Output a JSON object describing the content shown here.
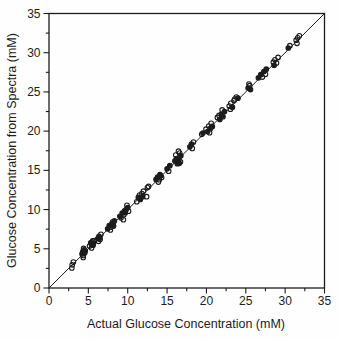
{
  "figure": {
    "background": "#fefefe",
    "ink_color": "#1c1c1c"
  },
  "chart_data": {
    "type": "scatter",
    "title": "",
    "xlabel": "Actual Glucose Concentration (mM)",
    "ylabel": "Glucose Concentration from Spectra (mM)",
    "xlim": [
      0,
      35
    ],
    "ylim": [
      0,
      35
    ],
    "x_major_ticks": [
      0,
      5,
      10,
      15,
      20,
      25,
      30,
      35
    ],
    "y_major_ticks": [
      0,
      5,
      10,
      15,
      20,
      25,
      30,
      35
    ],
    "minor_tick_interval": 2.5,
    "grid": false,
    "legend_position": "none",
    "reference_line": {
      "type": "identity",
      "from": [
        0,
        0
      ],
      "to": [
        35,
        35
      ]
    },
    "series": [
      {
        "name": "open-circles",
        "marker": "open-circle",
        "points": [
          [
            2.9,
            2.55
          ],
          [
            2.95,
            2.95
          ],
          [
            3.1,
            3.3
          ],
          [
            4.35,
            4.15
          ],
          [
            4.4,
            5.05
          ],
          [
            4.35,
            3.9
          ],
          [
            4.6,
            4.75
          ],
          [
            5.15,
            5.35
          ],
          [
            5.55,
            6.0
          ],
          [
            5.4,
            5.1
          ],
          [
            5.75,
            6.05
          ],
          [
            5.5,
            5.85
          ],
          [
            6.5,
            6.2
          ],
          [
            6.6,
            6.85
          ],
          [
            6.3,
            5.95
          ],
          [
            7.85,
            7.75
          ],
          [
            8.15,
            8.05
          ],
          [
            8.1,
            8.45
          ],
          [
            7.8,
            7.4
          ],
          [
            9.15,
            8.95
          ],
          [
            9.5,
            9.35
          ],
          [
            9.45,
            8.7
          ],
          [
            9.8,
            10.0
          ],
          [
            10.1,
            9.8
          ],
          [
            9.9,
            10.55
          ],
          [
            11.15,
            11.0
          ],
          [
            11.5,
            11.85
          ],
          [
            11.8,
            12.05
          ],
          [
            12.0,
            12.35
          ],
          [
            12.4,
            11.65
          ],
          [
            12.5,
            12.8
          ],
          [
            12.65,
            12.95
          ],
          [
            14.0,
            13.8
          ],
          [
            14.3,
            14.1
          ],
          [
            13.9,
            13.5
          ],
          [
            15.2,
            14.9
          ],
          [
            16.1,
            16.95
          ],
          [
            16.6,
            17.2
          ],
          [
            16.45,
            17.45
          ],
          [
            16.7,
            16.1
          ],
          [
            18.2,
            17.8
          ],
          [
            18.35,
            18.6
          ],
          [
            19.4,
            19.6
          ],
          [
            19.95,
            20.25
          ],
          [
            20.3,
            20.65
          ],
          [
            20.6,
            21.0
          ],
          [
            20.4,
            19.8
          ],
          [
            21.4,
            21.75
          ],
          [
            21.6,
            22.0
          ],
          [
            22.0,
            22.7
          ],
          [
            22.9,
            23.2
          ],
          [
            23.1,
            23.55
          ],
          [
            23.05,
            22.8
          ],
          [
            23.5,
            23.9
          ],
          [
            23.6,
            24.1
          ],
          [
            23.8,
            24.35
          ],
          [
            25.5,
            25.8
          ],
          [
            25.4,
            26.0
          ],
          [
            27.1,
            26.9
          ],
          [
            27.5,
            27.25
          ],
          [
            28.5,
            28.8
          ],
          [
            28.7,
            29.1
          ],
          [
            28.9,
            28.7
          ],
          [
            29.1,
            29.4
          ],
          [
            30.6,
            30.9
          ],
          [
            31.4,
            31.6
          ],
          [
            31.6,
            31.9
          ],
          [
            31.5,
            31.2
          ],
          [
            31.8,
            32.15
          ]
        ]
      },
      {
        "name": "filled-circles",
        "marker": "filled-circle",
        "points": [
          [
            4.2,
            4.35
          ],
          [
            4.3,
            4.65
          ],
          [
            4.45,
            4.85
          ],
          [
            4.55,
            4.5
          ],
          [
            5.3,
            5.75
          ],
          [
            5.45,
            5.5
          ],
          [
            5.65,
            5.7
          ],
          [
            5.6,
            5.45
          ],
          [
            6.2,
            6.3
          ],
          [
            6.35,
            6.6
          ],
          [
            6.45,
            6.45
          ],
          [
            7.45,
            7.55
          ],
          [
            7.65,
            7.95
          ],
          [
            8.0,
            8.25
          ],
          [
            8.3,
            8.55
          ],
          [
            8.2,
            7.9
          ],
          [
            9.0,
            9.15
          ],
          [
            9.3,
            9.55
          ],
          [
            9.6,
            9.85
          ],
          [
            10.0,
            10.25
          ],
          [
            9.7,
            9.6
          ],
          [
            11.35,
            11.55
          ],
          [
            11.6,
            11.3
          ],
          [
            11.9,
            11.65
          ],
          [
            13.6,
            13.85
          ],
          [
            13.8,
            14.15
          ],
          [
            14.1,
            14.45
          ],
          [
            14.2,
            14.3
          ],
          [
            15.0,
            15.2
          ],
          [
            15.35,
            15.6
          ],
          [
            16.0,
            16.2
          ],
          [
            16.2,
            16.5
          ],
          [
            16.3,
            15.85
          ],
          [
            16.5,
            16.4
          ],
          [
            16.75,
            16.85
          ],
          [
            16.55,
            15.9
          ],
          [
            17.9,
            18.0
          ],
          [
            18.1,
            18.35
          ],
          [
            19.55,
            19.75
          ],
          [
            20.15,
            19.95
          ],
          [
            20.5,
            20.35
          ],
          [
            20.75,
            20.6
          ],
          [
            21.7,
            21.5
          ],
          [
            21.9,
            22.15
          ],
          [
            22.1,
            21.85
          ],
          [
            22.3,
            22.5
          ],
          [
            23.3,
            23.05
          ],
          [
            24.0,
            24.2
          ],
          [
            25.3,
            25.5
          ],
          [
            25.6,
            25.3
          ],
          [
            26.6,
            26.8
          ],
          [
            26.9,
            27.2
          ],
          [
            27.3,
            27.6
          ],
          [
            27.6,
            27.9
          ],
          [
            28.6,
            28.4
          ],
          [
            30.4,
            30.6
          ]
        ]
      }
    ]
  }
}
